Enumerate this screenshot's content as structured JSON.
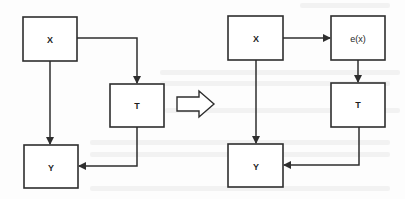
{
  "figure": {
    "colors": {
      "stroke": "#2e2e2e",
      "fill": "#ffffff",
      "text": "#1e1e1e"
    },
    "left_diagram": {
      "nodes": [
        {
          "id": "X",
          "label": "X"
        },
        {
          "id": "T",
          "label": "T"
        },
        {
          "id": "Y",
          "label": "Y"
        }
      ],
      "edges": [
        {
          "from": "X",
          "to": "T"
        },
        {
          "from": "X",
          "to": "Y"
        },
        {
          "from": "T",
          "to": "Y"
        }
      ]
    },
    "transform_arrow": {
      "label": "",
      "direction": "right"
    },
    "right_diagram": {
      "nodes": [
        {
          "id": "X",
          "label": "X"
        },
        {
          "id": "e",
          "label": "e(x)"
        },
        {
          "id": "T",
          "label": "T"
        },
        {
          "id": "Y",
          "label": "Y"
        }
      ],
      "edges": [
        {
          "from": "X",
          "to": "e(x)"
        },
        {
          "from": "e(x)",
          "to": "T"
        },
        {
          "from": "X",
          "to": "Y"
        },
        {
          "from": "T",
          "to": "Y"
        }
      ]
    }
  }
}
